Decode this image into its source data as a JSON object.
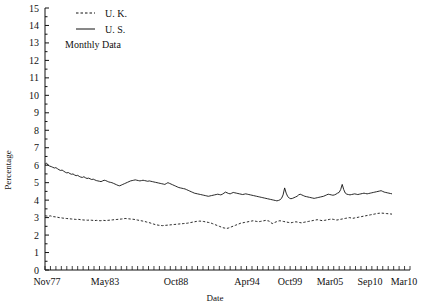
{
  "chart_data": {
    "type": "line",
    "title": "",
    "subtitle": "",
    "note": "Monthly Data",
    "xlabel": "Date",
    "ylabel": "Percentage",
    "grid": false,
    "legend_position": "top-left",
    "ylim": [
      0,
      15
    ],
    "ytick_labels": [
      "0",
      "1",
      "2",
      "3",
      "4",
      "5",
      "6",
      "7",
      "8",
      "9",
      "10",
      "11",
      "12",
      "13",
      "14",
      "15"
    ],
    "xtick_labels": [
      "Nov77",
      "May83",
      "Oct88",
      "Apr94",
      "Oct99",
      "Mar05",
      "Sep10",
      "Mar10"
    ],
    "xlim_labels": [
      "Nov77",
      "Mar10"
    ],
    "series": [
      {
        "name": "U. K.",
        "style": "dashed",
        "color": "#111111",
        "values": [
          3.1,
          3.09,
          3.08,
          3.1,
          3.07,
          3.05,
          3.04,
          3.02,
          3.0,
          2.99,
          2.97,
          2.96,
          2.95,
          2.94,
          2.93,
          2.92,
          2.91,
          2.9,
          2.89,
          2.9,
          2.88,
          2.87,
          2.86,
          2.86,
          2.85,
          2.86,
          2.85,
          2.84,
          2.83,
          2.84,
          2.83,
          2.82,
          2.83,
          2.84,
          2.83,
          2.84,
          2.85,
          2.86,
          2.87,
          2.88,
          2.89,
          2.9,
          2.91,
          2.92,
          2.93,
          2.95,
          2.94,
          2.93,
          2.92,
          2.91,
          2.9,
          2.88,
          2.86,
          2.84,
          2.82,
          2.8,
          2.78,
          2.75,
          2.72,
          2.7,
          2.66,
          2.63,
          2.6,
          2.58,
          2.56,
          2.55,
          2.54,
          2.55,
          2.56,
          2.57,
          2.58,
          2.59,
          2.6,
          2.61,
          2.62,
          2.63,
          2.64,
          2.65,
          2.66,
          2.67,
          2.68,
          2.7,
          2.72,
          2.74,
          2.76,
          2.78,
          2.79,
          2.8,
          2.79,
          2.78,
          2.76,
          2.74,
          2.72,
          2.7,
          2.66,
          2.62,
          2.58,
          2.54,
          2.5,
          2.46,
          2.42,
          2.4,
          2.38,
          2.4,
          2.44,
          2.48,
          2.52,
          2.56,
          2.6,
          2.64,
          2.68,
          2.7,
          2.72,
          2.74,
          2.76,
          2.78,
          2.8,
          2.82,
          2.8,
          2.78,
          2.76,
          2.78,
          2.8,
          2.82,
          2.84,
          2.82,
          2.8,
          2.7,
          2.66,
          2.72,
          2.76,
          2.8,
          2.82,
          2.8,
          2.78,
          2.76,
          2.74,
          2.72,
          2.7,
          2.72,
          2.74,
          2.76,
          2.74,
          2.72,
          2.7,
          2.72,
          2.74,
          2.76,
          2.78,
          2.8,
          2.82,
          2.84,
          2.86,
          2.88,
          2.86,
          2.84,
          2.82,
          2.84,
          2.86,
          2.88,
          2.9,
          2.92,
          2.9,
          2.88,
          2.86,
          2.88,
          2.9,
          2.92,
          2.94,
          2.96,
          2.98,
          3.0,
          2.98,
          2.96,
          2.98,
          3.0,
          3.02,
          3.04,
          3.06,
          3.08,
          3.1,
          3.12,
          3.14,
          3.16,
          3.18,
          3.2,
          3.22,
          3.24,
          3.25,
          3.26,
          3.25,
          3.24,
          3.23,
          3.22,
          3.21,
          3.2
        ]
      },
      {
        "name": "U. S.",
        "style": "solid",
        "color": "#111111",
        "values": [
          6.05,
          6.12,
          6.0,
          5.95,
          5.92,
          5.88,
          5.84,
          5.86,
          5.8,
          5.74,
          5.7,
          5.72,
          5.66,
          5.6,
          5.56,
          5.58,
          5.52,
          5.48,
          5.5,
          5.44,
          5.4,
          5.42,
          5.36,
          5.32,
          5.3,
          5.34,
          5.28,
          5.24,
          5.26,
          5.22,
          5.18,
          5.2,
          5.16,
          5.12,
          5.1,
          5.08,
          5.06,
          5.1,
          5.14,
          5.12,
          5.08,
          5.04,
          5.02,
          5.0,
          4.96,
          4.92,
          4.88,
          4.84,
          4.82,
          4.86,
          4.9,
          4.94,
          4.98,
          5.02,
          5.06,
          5.1,
          5.12,
          5.14,
          5.16,
          5.14,
          5.12,
          5.1,
          5.12,
          5.14,
          5.12,
          5.1,
          5.08,
          5.1,
          5.08,
          5.06,
          5.04,
          5.02,
          5.0,
          4.98,
          4.96,
          4.94,
          4.92,
          4.9,
          4.95,
          5.0,
          4.96,
          4.92,
          4.88,
          4.84,
          4.8,
          4.76,
          4.72,
          4.7,
          4.68,
          4.66,
          4.64,
          4.6,
          4.56,
          4.52,
          4.48,
          4.44,
          4.4,
          4.38,
          4.36,
          4.34,
          4.32,
          4.3,
          4.28,
          4.26,
          4.24,
          4.22,
          4.24,
          4.26,
          4.28,
          4.3,
          4.32,
          4.34,
          4.32,
          4.3,
          4.34,
          4.4,
          4.46,
          4.42,
          4.38,
          4.36,
          4.4,
          4.44,
          4.42,
          4.4,
          4.38,
          4.36,
          4.34,
          4.32,
          4.34,
          4.36,
          4.34,
          4.32,
          4.3,
          4.28,
          4.26,
          4.24,
          4.22,
          4.2,
          4.18,
          4.16,
          4.14,
          4.12,
          4.1,
          4.08,
          4.06,
          4.04,
          4.02,
          4.0,
          3.98,
          3.96,
          3.98,
          4.02,
          4.1,
          4.3,
          4.7,
          4.4,
          4.2,
          4.12,
          4.08,
          4.1,
          4.14,
          4.18,
          4.22,
          4.3,
          4.34,
          4.3,
          4.26,
          4.22,
          4.2,
          4.18,
          4.16,
          4.14,
          4.12,
          4.1,
          4.12,
          4.14,
          4.16,
          4.18,
          4.2,
          4.22,
          4.26,
          4.3,
          4.34,
          4.32,
          4.3,
          4.28,
          4.3,
          4.34,
          4.4,
          4.44,
          4.6,
          4.9,
          4.6,
          4.4,
          4.34,
          4.32,
          4.3,
          4.32,
          4.34,
          4.36,
          4.34,
          4.32,
          4.34,
          4.36,
          4.38,
          4.4,
          4.38,
          4.36,
          4.38,
          4.4,
          4.42,
          4.44,
          4.46,
          4.48,
          4.5,
          4.52,
          4.54,
          4.5,
          4.46,
          4.44,
          4.42,
          4.4,
          4.38,
          4.36
        ]
      }
    ]
  },
  "legend": {
    "items": [
      {
        "label": "U. K.",
        "style": "dashed"
      },
      {
        "label": "U. S.",
        "style": "solid"
      }
    ],
    "note": "Monthly Data"
  },
  "axes": {
    "y_title": "Percentage",
    "x_title": "Date"
  }
}
